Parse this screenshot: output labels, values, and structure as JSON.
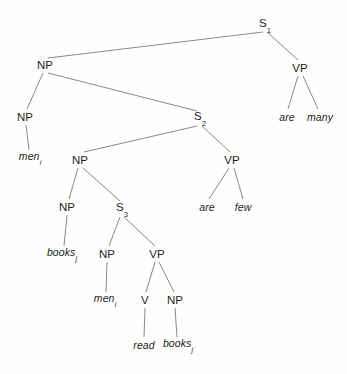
{
  "figure": {
    "background_color": "#fefefe",
    "line_color": "#7a7a7a",
    "text_color": "#1d1d1d"
  },
  "nodes": [
    {
      "id": "s1",
      "label": "S",
      "sub": "1",
      "x": 265,
      "y": 25,
      "type": "nonterminal"
    },
    {
      "id": "np1",
      "label": "NP",
      "sub": "",
      "x": 45,
      "y": 65,
      "type": "nonterminal"
    },
    {
      "id": "vp1",
      "label": "VP",
      "sub": "",
      "x": 300,
      "y": 68,
      "type": "nonterminal"
    },
    {
      "id": "np2",
      "label": "NP",
      "sub": "",
      "x": 25,
      "y": 117,
      "type": "nonterminal"
    },
    {
      "id": "s2",
      "label": "S",
      "sub": "2",
      "x": 200,
      "y": 118,
      "type": "nonterminal"
    },
    {
      "id": "np3",
      "label": "NP",
      "sub": "",
      "x": 80,
      "y": 160,
      "type": "nonterminal"
    },
    {
      "id": "vp2",
      "label": "VP",
      "sub": "",
      "x": 232,
      "y": 160,
      "type": "nonterminal"
    },
    {
      "id": "np4",
      "label": "NP",
      "sub": "",
      "x": 67,
      "y": 207,
      "type": "nonterminal"
    },
    {
      "id": "s3",
      "label": "S",
      "sub": "3",
      "x": 122,
      "y": 209,
      "type": "nonterminal"
    },
    {
      "id": "np5",
      "label": "NP",
      "sub": "",
      "x": 107,
      "y": 254,
      "type": "nonterminal"
    },
    {
      "id": "vp3",
      "label": "VP",
      "sub": "",
      "x": 157,
      "y": 254,
      "type": "nonterminal"
    },
    {
      "id": "v1",
      "label": "V",
      "sub": "",
      "x": 145,
      "y": 300,
      "type": "nonterminal"
    },
    {
      "id": "np6",
      "label": "NP",
      "sub": "",
      "x": 175,
      "y": 300,
      "type": "nonterminal"
    }
  ],
  "leaves": [
    {
      "id": "are1",
      "label": "are",
      "sub": "",
      "x": 287,
      "y": 117
    },
    {
      "id": "many1",
      "label": "many",
      "sub": "",
      "x": 320,
      "y": 117
    },
    {
      "id": "men1",
      "label": "men",
      "sub": "i",
      "x": 30,
      "y": 158
    },
    {
      "id": "are2",
      "label": "are",
      "sub": "",
      "x": 207,
      "y": 207
    },
    {
      "id": "few1",
      "label": "few",
      "sub": "",
      "x": 243,
      "y": 207
    },
    {
      "id": "books1",
      "label": "books",
      "sub": "j",
      "x": 62,
      "y": 254
    },
    {
      "id": "men2",
      "label": "men",
      "sub": "i",
      "x": 105,
      "y": 300
    },
    {
      "id": "read1",
      "label": "read",
      "sub": "",
      "x": 144,
      "y": 345
    },
    {
      "id": "books2",
      "label": "books",
      "sub": "j",
      "x": 178,
      "y": 345
    }
  ],
  "edges": [
    {
      "from": "s1",
      "to": "np1",
      "x1": 263,
      "y1": 32,
      "x2": 48,
      "y2": 58
    },
    {
      "from": "s1",
      "to": "vp1",
      "x1": 267,
      "y1": 32,
      "x2": 298,
      "y2": 60
    },
    {
      "from": "vp1",
      "to": "are1",
      "x1": 298,
      "y1": 76,
      "x2": 288,
      "y2": 109
    },
    {
      "from": "vp1",
      "to": "many1",
      "x1": 303,
      "y1": 76,
      "x2": 318,
      "y2": 109
    },
    {
      "from": "np1",
      "to": "np2",
      "x1": 43,
      "y1": 73,
      "x2": 27,
      "y2": 109
    },
    {
      "from": "np1",
      "to": "s2",
      "x1": 48,
      "y1": 73,
      "x2": 197,
      "y2": 111
    },
    {
      "from": "np2",
      "to": "men1",
      "x1": 26,
      "y1": 125,
      "x2": 29,
      "y2": 150
    },
    {
      "from": "s2",
      "to": "np3",
      "x1": 197,
      "y1": 126,
      "x2": 84,
      "y2": 152
    },
    {
      "from": "s2",
      "to": "vp2",
      "x1": 202,
      "y1": 126,
      "x2": 230,
      "y2": 152
    },
    {
      "from": "vp2",
      "to": "are2",
      "x1": 229,
      "y1": 168,
      "x2": 209,
      "y2": 199
    },
    {
      "from": "vp2",
      "to": "few1",
      "x1": 234,
      "y1": 168,
      "x2": 243,
      "y2": 199
    },
    {
      "from": "np3",
      "to": "np4",
      "x1": 78,
      "y1": 168,
      "x2": 69,
      "y2": 199
    },
    {
      "from": "np3",
      "to": "s3",
      "x1": 83,
      "y1": 168,
      "x2": 120,
      "y2": 201
    },
    {
      "from": "np4",
      "to": "books1",
      "x1": 67,
      "y1": 215,
      "x2": 64,
      "y2": 246
    },
    {
      "from": "s3",
      "to": "np5",
      "x1": 120,
      "y1": 217,
      "x2": 109,
      "y2": 246
    },
    {
      "from": "s3",
      "to": "vp3",
      "x1": 124,
      "y1": 217,
      "x2": 155,
      "y2": 246
    },
    {
      "from": "np5",
      "to": "men2",
      "x1": 107,
      "y1": 262,
      "x2": 106,
      "y2": 292
    },
    {
      "from": "vp3",
      "to": "v1",
      "x1": 155,
      "y1": 262,
      "x2": 146,
      "y2": 292
    },
    {
      "from": "vp3",
      "to": "np6",
      "x1": 159,
      "y1": 262,
      "x2": 174,
      "y2": 292
    },
    {
      "from": "v1",
      "to": "read1",
      "x1": 145,
      "y1": 308,
      "x2": 144,
      "y2": 337
    },
    {
      "from": "np6",
      "to": "books2",
      "x1": 175,
      "y1": 308,
      "x2": 177,
      "y2": 337
    }
  ]
}
